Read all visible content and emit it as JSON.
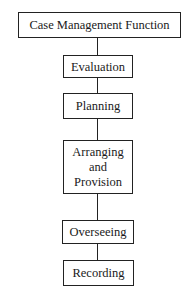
{
  "diagram": {
    "type": "flowchart-vertical",
    "root": {
      "label": "Case Management Function"
    },
    "steps": [
      {
        "label": "Evaluation"
      },
      {
        "label": "Planning"
      },
      {
        "label": "Arranging and Provision",
        "lines": [
          "Arranging",
          "and",
          "Provision"
        ]
      },
      {
        "label": "Overseeing"
      },
      {
        "label": "Recording"
      }
    ],
    "colors": {
      "stroke": "#222222",
      "background": "#ffffff",
      "text": "#1a1a1a"
    }
  }
}
